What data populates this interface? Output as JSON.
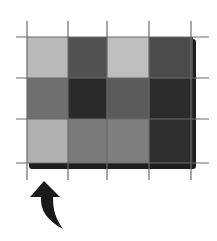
{
  "figure": {
    "grid": {
      "rows": 3,
      "cols": 4,
      "origin": [
        27,
        37
      ],
      "col_edges": [
        27,
        68,
        107,
        149,
        193
      ],
      "row_edges": [
        37,
        78,
        119,
        163
      ],
      "line_color": "#6a6a6a",
      "shadow_color": "#1e1e1e",
      "cells": [
        [
          "#b9b9b9",
          "#515151",
          "#bebebe",
          "#4b4b4b"
        ],
        [
          "#6f6f6f",
          "#2a2a2a",
          "#5b5b5b",
          "#2c2c2c"
        ],
        [
          "#b1b1b1",
          "#7a7a7a",
          "#7f7f7f",
          "#2f2f2f"
        ]
      ],
      "vertical_lines": {
        "x": [
          27,
          68,
          107,
          149,
          191
        ],
        "y_start": 21,
        "y_end": 180
      },
      "horizontal_lines": {
        "y": [
          37,
          78,
          119,
          163
        ],
        "x_start": 16,
        "x_end": 209
      }
    },
    "arrow": {
      "icon": "curved-up-arrow-icon",
      "color": "#1a1a1a",
      "tip": [
        44,
        181
      ],
      "tail": [
        63,
        229
      ]
    }
  }
}
